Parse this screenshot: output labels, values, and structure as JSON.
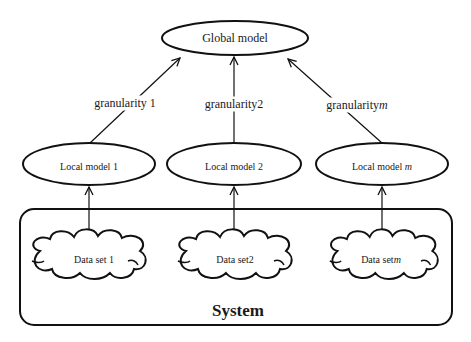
{
  "diagram": {
    "global_model": {
      "label": "Global model"
    },
    "granularities": [
      {
        "label": "granularity 1",
        "suffix": ""
      },
      {
        "label": "granularity2",
        "suffix": ""
      },
      {
        "label": "granularity",
        "suffix": "m"
      }
    ],
    "local_models": [
      {
        "label": "Local model 1",
        "suffix": ""
      },
      {
        "label": "Local model 2",
        "suffix": ""
      },
      {
        "label": "Local model ",
        "suffix": "m"
      }
    ],
    "data_sets": [
      {
        "label": "Data set 1",
        "suffix": ""
      },
      {
        "label": "Data set2",
        "suffix": ""
      },
      {
        "label": "Data set",
        "suffix": "m"
      }
    ],
    "system": {
      "label": "System"
    },
    "caption": "",
    "colors": {
      "stroke": "#111111",
      "background": "#ffffff"
    }
  }
}
